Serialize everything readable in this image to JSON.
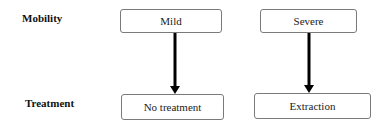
{
  "diagram": {
    "row_labels": {
      "top": "Mobility",
      "bottom": "Treatment"
    },
    "nodes": [
      {
        "id": "mild",
        "label": "Mild"
      },
      {
        "id": "severe",
        "label": "Severe"
      },
      {
        "id": "no-treatment",
        "label": "No treatment"
      },
      {
        "id": "extraction",
        "label": "Extraction"
      }
    ],
    "edges": [
      {
        "from": "mild",
        "to": "no-treatment"
      },
      {
        "from": "severe",
        "to": "extraction"
      }
    ],
    "colors": {
      "arrow": "#000000",
      "box_border": "#7a7a7a",
      "background": "#ffffff"
    }
  }
}
